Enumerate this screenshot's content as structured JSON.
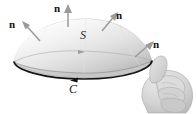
{
  "figure": {
    "background_color": "#ffffff",
    "width": 196,
    "height": 114,
    "surface": {
      "name": "S",
      "label": "S",
      "shape": "dome",
      "fill_light": "#fdfdfd",
      "fill_mid": "#e3e3e3",
      "fill_dark": "#b9b9b9",
      "rim_color": "#8c8c8c"
    },
    "boundary": {
      "name": "C",
      "label": "C",
      "color": "#111111",
      "orientation": "counterclockwise",
      "arrow_direction": "left"
    },
    "normals": [
      {
        "id": "n-left",
        "label": "n",
        "direction": "up-left",
        "arrow_color": "#9a9a9a"
      },
      {
        "id": "n-top",
        "label": "n",
        "direction": "up",
        "arrow_color": "#9a9a9a"
      },
      {
        "id": "n-right",
        "label": "n",
        "direction": "up-right",
        "arrow_color": "#9a9a9a"
      },
      {
        "id": "n-lower",
        "label": "n",
        "direction": "up-right",
        "arrow_color": "#9a9a9a"
      }
    ],
    "hand": {
      "gesture": "thumbs-up",
      "description": "right hand with thumb pointing up and fingers curled",
      "skin_color": "#d5d5d5",
      "shade_color": "#bdbdbd",
      "outline_color": "#a2a2a2"
    },
    "inner_arrow": {
      "label": "",
      "color": "#9d9d9d"
    }
  }
}
